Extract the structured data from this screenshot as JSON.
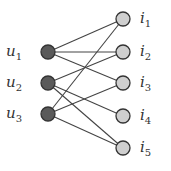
{
  "diagram": {
    "type": "bipartite-graph",
    "colors": {
      "user_fill": "#5a5a5a",
      "item_fill": "#cfcfcf",
      "stroke": "#333333",
      "edge": "#444444",
      "text": "#333333"
    },
    "users": [
      {
        "id": "u1",
        "base": "u",
        "sub": "1",
        "x": 48,
        "y": 52
      },
      {
        "id": "u2",
        "base": "u",
        "sub": "2",
        "x": 48,
        "y": 83
      },
      {
        "id": "u3",
        "base": "u",
        "sub": "3",
        "x": 48,
        "y": 114
      }
    ],
    "items": [
      {
        "id": "i1",
        "base": "i",
        "sub": "1",
        "x": 123,
        "y": 19
      },
      {
        "id": "i2",
        "base": "i",
        "sub": "2",
        "x": 123,
        "y": 52
      },
      {
        "id": "i3",
        "base": "i",
        "sub": "3",
        "x": 123,
        "y": 83
      },
      {
        "id": "i4",
        "base": "i",
        "sub": "4",
        "x": 123,
        "y": 116
      },
      {
        "id": "i5",
        "base": "i",
        "sub": "5",
        "x": 123,
        "y": 148
      }
    ],
    "edges": [
      [
        "u1",
        "i1"
      ],
      [
        "u1",
        "i2"
      ],
      [
        "u1",
        "i3"
      ],
      [
        "u2",
        "i2"
      ],
      [
        "u2",
        "i4"
      ],
      [
        "u2",
        "i5"
      ],
      [
        "u3",
        "i1"
      ],
      [
        "u3",
        "i3"
      ],
      [
        "u3",
        "i5"
      ]
    ]
  }
}
